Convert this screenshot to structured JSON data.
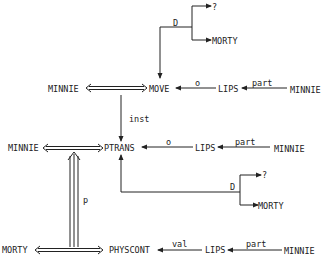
{
  "diagram": {
    "type": "conceptual-dependency",
    "nodes": {
      "move_actor": "MINNIE",
      "move": "MOVE",
      "move_object": "LIPS",
      "move_object_owner": "MINNIE",
      "move_dir_from": "?",
      "move_dir_to": "MORTY",
      "ptrans_actor": "MINNIE",
      "ptrans": "PTRANS",
      "ptrans_object": "LIPS",
      "ptrans_object_owner": "MINNIE",
      "ptrans_dir_from": "?",
      "ptrans_dir_to": "MORTY",
      "physcont_actor": "MORTY",
      "physcont": "PHYSCONT",
      "physcont_value": "LIPS",
      "physcont_value_owner": "MINNIE"
    },
    "edge_labels": {
      "move_dir": "D",
      "move_object": "o",
      "move_part": "part",
      "inst": "inst",
      "ptrans_object": "o",
      "ptrans_part": "part",
      "ptrans_dir": "D",
      "result": "p",
      "physcont_val": "val",
      "physcont_part": "part"
    }
  }
}
